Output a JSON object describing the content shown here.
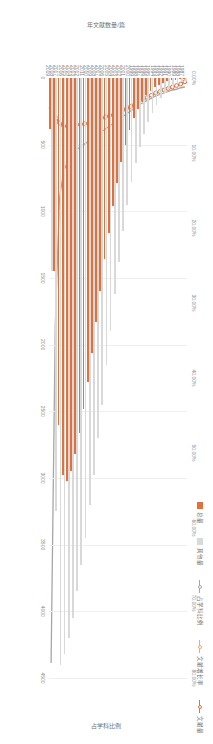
{
  "chart_data": {
    "type": "bar",
    "title": "",
    "xlabel": "",
    "ylabel": "年文献数量/篇",
    "y2label": "占学科比例",
    "ylim": [
      0,
      4500
    ],
    "y2lim": [
      0,
      0.8
    ],
    "grid": true,
    "legend_position": "top-right",
    "categories": [
      "1987",
      "1988",
      "1989",
      "1990",
      "1991",
      "1992",
      "1993",
      "1994",
      "1995",
      "1996",
      "1997",
      "1998",
      "1999",
      "2000",
      "2001",
      "2002",
      "2003",
      "2004",
      "2005",
      "2006",
      "2007",
      "2008",
      "2009",
      "2010",
      "2011",
      "2012",
      "2013",
      "2014",
      "2015",
      "2016",
      "2017",
      "2018",
      "2019"
    ],
    "ytick_labels": [
      "0",
      "500",
      "1000",
      "1500",
      "2000",
      "2500",
      "3000",
      "3500",
      "4000",
      "4500"
    ],
    "ytick_values": [
      0,
      500,
      1000,
      1500,
      2000,
      2500,
      3000,
      3500,
      4000,
      4500
    ],
    "y2tick_labels": [
      "0.00%",
      "10.00%",
      "20.00%",
      "30.00%",
      "40.00%",
      "50.00%",
      "60.00%",
      "70.00%",
      "80.00%"
    ],
    "y2tick_values": [
      0,
      10,
      20,
      30,
      40,
      50,
      60,
      70,
      80
    ],
    "series": [
      {
        "name": "总量",
        "type": "bar",
        "color": "#d9d9d9",
        "values": [
          20,
          30,
          45,
          60,
          80,
          110,
          150,
          200,
          260,
          330,
          420,
          520,
          640,
          780,
          950,
          1150,
          1380,
          1620,
          1900,
          2150,
          2450,
          2700,
          2980,
          3200,
          3450,
          3650,
          3850,
          4050,
          4200,
          4320,
          4400,
          3250,
          1450
        ]
      },
      {
        "name": "其他量",
        "type": "bar",
        "color": "#e2703a",
        "values": [
          5,
          8,
          12,
          18,
          25,
          35,
          50,
          70,
          95,
          130,
          175,
          230,
          300,
          390,
          500,
          630,
          790,
          960,
          1160,
          1360,
          1600,
          1830,
          2060,
          2280,
          2480,
          2660,
          2820,
          2950,
          3020,
          2980,
          2600,
          1450,
          380
        ]
      },
      {
        "name": "占学科比例",
        "type": "line",
        "color": "#a6a6a6",
        "values": [
          1.2,
          1.3,
          1.5,
          1.6,
          1.8,
          2.0,
          2.2,
          2.4,
          2.7,
          3.0,
          3.3,
          3.6,
          4.0,
          4.4,
          4.8,
          5.2,
          5.6,
          6.0,
          6.4,
          6.8,
          7.2,
          7.6,
          8.0,
          8.4,
          8.8,
          9.2,
          9.6,
          10.2,
          11.0,
          12.5,
          16.0,
          33.0,
          78.0
        ]
      },
      {
        "name": "文献增长率",
        "type": "line",
        "color": "#e2703a",
        "values": [
          0.5,
          0.8,
          1.0,
          1.2,
          1.4,
          1.6,
          1.8,
          2.0,
          2.3,
          2.6,
          2.9,
          3.2,
          3.5,
          3.8,
          4.1,
          4.4,
          4.6,
          4.8,
          5.0,
          5.2,
          5.4,
          5.6,
          5.8,
          6.0,
          6.1,
          6.2,
          6.3,
          6.4,
          6.5,
          6.4,
          6.0,
          5.2,
          4.0
        ]
      }
    ]
  },
  "legend": {
    "items": [
      {
        "label": "总量",
        "marker": "box",
        "color": "#e2703a"
      },
      {
        "label": "其他量",
        "marker": "box",
        "color": "#d9d9d9"
      },
      {
        "label": "占学科比例",
        "marker": "line",
        "color": "#a6a6a6"
      },
      {
        "label": "文献增长率",
        "marker": "line",
        "color": "#f0a878"
      },
      {
        "label": "文献量",
        "marker": "line",
        "color": "#e2703a"
      }
    ]
  },
  "axes": {
    "left_title": "年文献数量/篇",
    "right_title": "占学科比例"
  }
}
